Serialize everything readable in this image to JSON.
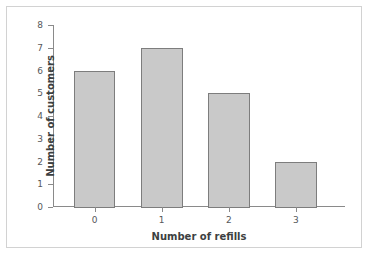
{
  "chart_data": {
    "type": "bar",
    "title": "",
    "categories": [
      "0",
      "1",
      "2",
      "3"
    ],
    "values": [
      6,
      7,
      5,
      2
    ],
    "xlabel": "Number of refills",
    "ylabel": "Number of customers",
    "ylim": [
      0,
      8
    ],
    "ytick_labels": [
      "0",
      "1",
      "2",
      "3",
      "4",
      "5",
      "6",
      "7",
      "8"
    ],
    "ytick_step": 1,
    "grid": false,
    "legend": null,
    "bar_fill_color": "#c9c9c9",
    "bar_edge_color": "#7d7d7d",
    "axis_color": "#8a8a8a",
    "label_color": "#3c3f41",
    "tick_label_color": "#56585a",
    "border_color": "#d2d2d2"
  }
}
